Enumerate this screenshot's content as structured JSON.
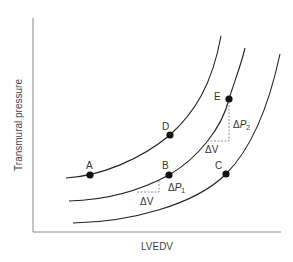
{
  "diagram": {
    "type": "pressure-volume curves",
    "axes": {
      "x_label": "LVEDV",
      "y_label": "Transmural pressure"
    },
    "curves": [
      {
        "name": "left-curve",
        "passes_through": [
          "A",
          "D"
        ]
      },
      {
        "name": "middle-curve",
        "passes_through": [
          "B",
          "E"
        ]
      },
      {
        "name": "right-curve",
        "passes_through": [
          "C"
        ]
      }
    ],
    "points": [
      {
        "label": "A",
        "x": 90,
        "y": 175
      },
      {
        "label": "B",
        "x": 169,
        "y": 175
      },
      {
        "label": "C",
        "x": 226,
        "y": 174
      },
      {
        "label": "D",
        "x": 170,
        "y": 135
      },
      {
        "label": "E",
        "x": 229,
        "y": 99
      }
    ],
    "annotations": {
      "dv1": "ΔV",
      "dp1_delta": "Δ",
      "dp1_P": "P",
      "dp1_sub": "1",
      "dv2": "ΔV",
      "dp2_delta": "Δ",
      "dp2_P": "P",
      "dp2_sub": "2"
    }
  }
}
